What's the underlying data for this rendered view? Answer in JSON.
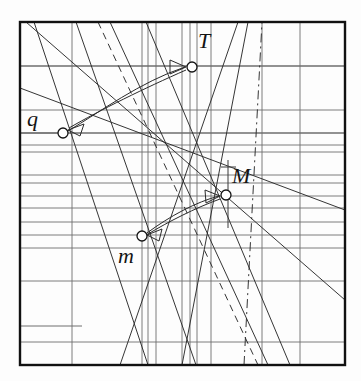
{
  "figure": {
    "background_color": "#fdfdfd",
    "frame": {
      "x": 20,
      "y": 22,
      "width": 325,
      "height": 343,
      "stroke": "#111111",
      "stroke_width": 2.4
    },
    "grid": {
      "stroke": "#6e6e6e",
      "stroke_width": 0.9,
      "horizontal_y": [
        66,
        110,
        133,
        145,
        152,
        175,
        183,
        196,
        208,
        222,
        235,
        248,
        281,
        342
      ],
      "horizontal_emphasis_y": [
        66,
        133
      ],
      "vertical_x": [
        72,
        142,
        148,
        156,
        182,
        190,
        197,
        211,
        262,
        300
      ],
      "short_horizontal": [
        {
          "x1": 20,
          "x2": 82,
          "y": 326
        },
        {
          "x1": 20,
          "x2": 58,
          "y": 133
        }
      ]
    },
    "diagonals": [
      {
        "name": "d1",
        "x1": 34,
        "y1": 22,
        "x2": 148,
        "y2": 365,
        "style": "solid"
      },
      {
        "name": "d2",
        "x1": 76,
        "y1": 22,
        "x2": 196,
        "y2": 365,
        "style": "solid"
      },
      {
        "name": "d3",
        "x1": 98,
        "y1": 22,
        "x2": 258,
        "y2": 365,
        "style": "dashed"
      },
      {
        "name": "d4",
        "x1": 110,
        "y1": 22,
        "x2": 268,
        "y2": 365,
        "style": "solid"
      },
      {
        "name": "d5",
        "x1": 26,
        "y1": 22,
        "x2": 345,
        "y2": 300,
        "style": "solid"
      },
      {
        "name": "d6",
        "x1": 120,
        "y1": 365,
        "x2": 238,
        "y2": 22,
        "style": "solid"
      },
      {
        "name": "d7",
        "x1": 182,
        "y1": 365,
        "x2": 248,
        "y2": 22,
        "style": "solid"
      },
      {
        "name": "d8",
        "x1": 146,
        "y1": 22,
        "x2": 290,
        "y2": 365,
        "style": "solid"
      },
      {
        "name": "d9",
        "x1": 244,
        "y1": 365,
        "x2": 262,
        "y2": 22,
        "style": "dashdot"
      },
      {
        "name": "d10",
        "x1": 20,
        "y1": 88,
        "x2": 345,
        "y2": 210,
        "style": "solid"
      }
    ],
    "markers": [
      {
        "id": "T",
        "label": "T",
        "cx": 192,
        "cy": 67,
        "r": 5.0
      },
      {
        "id": "q",
        "label": "q",
        "cx": 63,
        "cy": 133,
        "r": 5.0
      },
      {
        "id": "M",
        "label": "M",
        "cx": 226,
        "cy": 195,
        "r": 5.0
      },
      {
        "id": "m",
        "label": "m",
        "cx": 142,
        "cy": 236,
        "r": 5.0
      }
    ],
    "arrows": [
      {
        "name": "arrow-q-to-T",
        "from": "q",
        "to": "T",
        "path": "M 68 131 C 100 112, 140 82, 185 67",
        "head_at": "T",
        "head_points": "186,67 170,60 170,74"
      },
      {
        "name": "arrow-T-to-q",
        "from": "T",
        "to": "q",
        "path": "M 186 70 C 145 88, 100 110, 69 128",
        "head_at": "q",
        "head_points": "68,130 84,124 80,136"
      },
      {
        "name": "arrow-m-to-M",
        "from": "m",
        "to": "M",
        "path": "M 147 233 C 170 216, 196 202, 219 196",
        "head_at": "M",
        "head_points": "220,196 205,190 206,203"
      },
      {
        "name": "arrow-M-to-m",
        "from": "M",
        "to": "m",
        "path": "M 220 199 C 195 208, 168 222, 148 234",
        "head_at": "m",
        "head_points": "147,235 162,229 159,241"
      }
    ],
    "tick_marks": [
      {
        "name": "tick-M-vertical",
        "x": 228,
        "y1": 160,
        "y2": 228
      },
      {
        "name": "tick-M-cross",
        "x1": 221,
        "x2": 236,
        "y": 167
      }
    ],
    "colors": {
      "ink": "#141414",
      "grid": "#6e6e6e",
      "frame": "#111111",
      "paper": "#fdfdfd"
    }
  },
  "chart_data": {
    "type": "line",
    "title": "",
    "xlabel": "",
    "ylabel": "",
    "grid": true,
    "legend": "none",
    "annotations": [
      "T",
      "q",
      "M",
      "m"
    ],
    "series": [
      {
        "name": "T",
        "x": 192,
        "y": 67
      },
      {
        "name": "q",
        "x": 63,
        "y": 133
      },
      {
        "name": "M",
        "x": 226,
        "y": 195
      },
      {
        "name": "m",
        "x": 142,
        "y": 236
      }
    ]
  }
}
